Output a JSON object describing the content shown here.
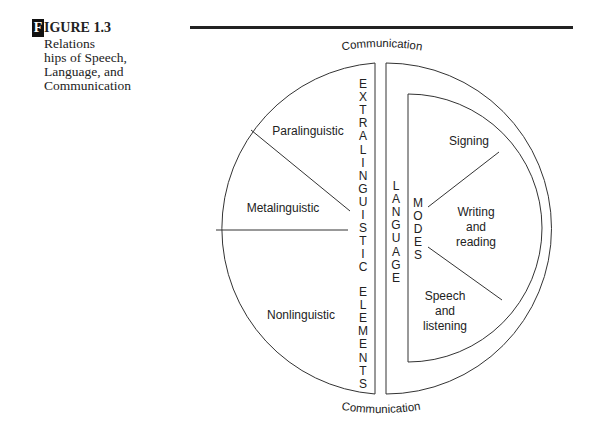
{
  "figure": {
    "label_letter": "F",
    "label_rest": "IGURE 1.3",
    "caption_lines": [
      "Relations",
      "hips of Speech,",
      "Language, and",
      "Communication"
    ]
  },
  "diagram": {
    "top_label": "Communication",
    "bottom_label": "Communication",
    "left_half": {
      "vertical_label_1": "EXTRALINGUISTIC",
      "vertical_label_2": "ELEMENTS",
      "sections": [
        "Paralinguistic",
        "Metalinguistic",
        "Nonlinguistic"
      ]
    },
    "right_half": {
      "vertical_label_outer": "LANGUAGE",
      "vertical_label_inner": "MODES",
      "sections": [
        {
          "lines": [
            "Signing"
          ]
        },
        {
          "lines": [
            "Writing",
            "and",
            "reading"
          ]
        },
        {
          "lines": [
            "Speech",
            "and",
            "listening"
          ]
        }
      ]
    },
    "colors": {
      "stroke": "#333333",
      "text": "#222222"
    }
  }
}
